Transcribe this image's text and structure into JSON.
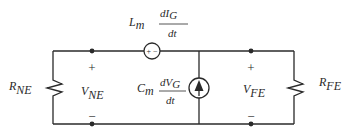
{
  "diagram": {
    "type": "circuit",
    "left_resistor": {
      "label": "R",
      "sub": "NE"
    },
    "right_resistor": {
      "label": "R",
      "sub": "FE"
    },
    "left_voltage": {
      "label": "V",
      "sub": "NE",
      "plus": "+",
      "minus": "−"
    },
    "right_voltage": {
      "label": "V",
      "sub": "FE",
      "plus": "+",
      "minus": "−"
    },
    "voltage_source": {
      "coef": "L",
      "coef_sub": "m",
      "num": "dI",
      "num_sub": "G",
      "den": "dt",
      "inner_polarity": "+ −"
    },
    "current_source": {
      "coef": "C",
      "coef_sub": "m",
      "num": "dV",
      "num_sub": "G",
      "den": "dt"
    }
  }
}
